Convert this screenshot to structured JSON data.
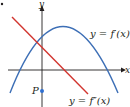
{
  "figure": {
    "type": "function-graph",
    "axes": {
      "x_label": "x",
      "y_label": "y",
      "color": "#231f20"
    },
    "curves": [
      {
        "name": "first-derivative",
        "label": "y = f′(x)",
        "shape": "downward parabola",
        "color": "#3d6fb6"
      },
      {
        "name": "second-derivative",
        "label": "y = f″(x)",
        "shape": "decreasing line",
        "color": "#d2352f"
      }
    ],
    "points": [
      {
        "label": "P",
        "description": "point on negative y-axis",
        "color": "#2f6fd0"
      }
    ],
    "bullet": "•"
  }
}
